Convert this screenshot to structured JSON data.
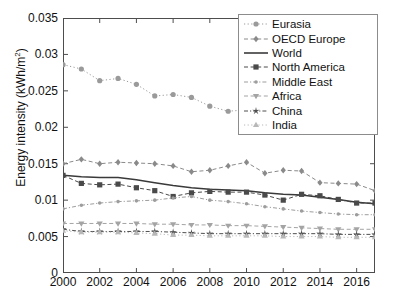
{
  "chart_data": {
    "type": "line",
    "title": "",
    "xlabel": "",
    "ylabel": "Energy intensity (kWh/m2)",
    "ylabel_text": "Energy intensity (kWh/m",
    "ylabel_sup": "2",
    "ylabel_tail": ")",
    "x": [
      2000,
      2001,
      2002,
      2003,
      2004,
      2005,
      2006,
      2007,
      2008,
      2009,
      2010,
      2011,
      2012,
      2013,
      2014,
      2015,
      2016,
      2017
    ],
    "xlim": [
      2000,
      2017
    ],
    "ylim": [
      0,
      0.035
    ],
    "xticks": [
      2000,
      2002,
      2004,
      2006,
      2008,
      2010,
      2012,
      2014,
      2016
    ],
    "xtick_labels": [
      "2000",
      "2002",
      "2004",
      "2006",
      "2008",
      "2010",
      "2012",
      "2014",
      "2016"
    ],
    "yticks": [
      0,
      0.005,
      0.01,
      0.015,
      0.02,
      0.025,
      0.03,
      0.035
    ],
    "ytick_labels": [
      "0",
      "0.005",
      "0.01",
      "0.015",
      "0.02",
      "0.025",
      "0.03",
      "0.035"
    ],
    "grid": false,
    "legend_position": "top-right",
    "series": [
      {
        "name": "Eurasia",
        "marker": "circle",
        "linestyle": "dotted",
        "color": "#9a9a9a",
        "values": [
          0.0286,
          0.028,
          0.0264,
          0.0267,
          0.0259,
          0.0243,
          0.0245,
          0.0241,
          0.0229,
          0.0222,
          0.0224,
          0.0227,
          0.0215,
          0.0208,
          0.0205,
          0.0202,
          0.0198,
          0.0198
        ]
      },
      {
        "name": "OECD Europe",
        "marker": "diamond",
        "linestyle": "dashed",
        "color": "#8a8a8a",
        "values": [
          0.015,
          0.0156,
          0.015,
          0.0152,
          0.0151,
          0.015,
          0.0147,
          0.0139,
          0.0141,
          0.0147,
          0.0152,
          0.0137,
          0.0141,
          0.014,
          0.0124,
          0.0123,
          0.0122,
          0.0113
        ]
      },
      {
        "name": "World",
        "marker": "none",
        "linestyle": "solid",
        "color": "#3a3a3a",
        "values": [
          0.0134,
          0.0132,
          0.0131,
          0.0131,
          0.0128,
          0.0124,
          0.012,
          0.0117,
          0.0115,
          0.0114,
          0.0113,
          0.011,
          0.0108,
          0.0107,
          0.0104,
          0.0101,
          0.0097,
          0.0095
        ]
      },
      {
        "name": "North America",
        "marker": "square",
        "linestyle": "dashed",
        "color": "#4a4a4a",
        "values": [
          0.0134,
          0.0123,
          0.0121,
          0.0122,
          0.0117,
          0.0113,
          0.0105,
          0.011,
          0.0112,
          0.0111,
          0.0111,
          0.0107,
          0.01,
          0.0108,
          0.0106,
          0.0101,
          0.0096,
          0.0096
        ]
      },
      {
        "name": "Middle East",
        "marker": "dot",
        "linestyle": "dash-dot",
        "color": "#9d9d9d",
        "values": [
          0.0088,
          0.0093,
          0.0096,
          0.0098,
          0.0099,
          0.01,
          0.0103,
          0.0105,
          0.01,
          0.0098,
          0.0095,
          0.0091,
          0.0088,
          0.0085,
          0.0083,
          0.0081,
          0.008,
          0.008
        ]
      },
      {
        "name": "Africa",
        "marker": "triangle-down",
        "linestyle": "dashed",
        "color": "#a4a4a4",
        "values": [
          0.0068,
          0.0068,
          0.0068,
          0.0068,
          0.0068,
          0.0067,
          0.0067,
          0.0066,
          0.0066,
          0.0065,
          0.0065,
          0.0064,
          0.0063,
          0.0062,
          0.0061,
          0.006,
          0.006,
          0.006
        ]
      },
      {
        "name": "China",
        "marker": "star",
        "linestyle": "dash-dot",
        "color": "#4f4f4f",
        "values": [
          0.006,
          0.0057,
          0.0057,
          0.0057,
          0.0057,
          0.0057,
          0.0056,
          0.0055,
          0.0054,
          0.0054,
          0.0054,
          0.0054,
          0.0054,
          0.0054,
          0.0054,
          0.0053,
          0.0053,
          0.0053
        ]
      },
      {
        "name": "India",
        "marker": "triangle-up",
        "linestyle": "dotted",
        "color": "#b8b8b8",
        "values": [
          0.0058,
          0.0056,
          0.0056,
          0.0056,
          0.0055,
          0.0054,
          0.0052,
          0.0052,
          0.0051,
          0.0051,
          0.0051,
          0.0051,
          0.005,
          0.005,
          0.005,
          0.0049,
          0.0049,
          0.0049
        ]
      }
    ]
  },
  "legend": {
    "items": [
      {
        "label": "Eurasia"
      },
      {
        "label": "OECD Europe"
      },
      {
        "label": "World"
      },
      {
        "label": "North America"
      },
      {
        "label": "Middle East"
      },
      {
        "label": "Africa"
      },
      {
        "label": "China"
      },
      {
        "label": "India"
      }
    ]
  }
}
